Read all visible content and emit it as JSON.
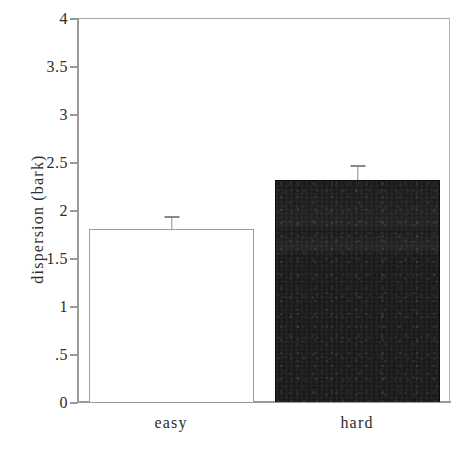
{
  "chart_data": {
    "type": "bar",
    "title": "",
    "xlabel": "",
    "ylabel": "dispersion (bark)",
    "categories": [
      "easy",
      "hard"
    ],
    "values": [
      1.8,
      2.31
    ],
    "errors": [
      0.14,
      0.16
    ],
    "series": [
      {
        "name": "dispersion",
        "values": [
          1.8,
          2.31
        ],
        "errors": [
          0.14,
          0.16
        ]
      }
    ],
    "ylim": [
      0,
      4
    ],
    "yticks": [
      0,
      0.5,
      1,
      1.5,
      2,
      2.5,
      3,
      3.5,
      4
    ],
    "ytick_labels": [
      "0",
      ".5",
      "1",
      "1.5",
      "2",
      "2.5",
      "3",
      "3.5",
      "4"
    ],
    "grid": false,
    "legend": null,
    "bar_styles": [
      "open",
      "filled"
    ],
    "colors": {
      "bar_open_fill": "#ffffff",
      "bar_open_stroke": "#9d9d9d",
      "bar_filled_fill": "#151515",
      "axis": "#9a9a9a",
      "text": "#2b2b2b"
    }
  },
  "axis": {
    "y_title": "dispersion (bark)",
    "tick_labels": [
      "4",
      "3.5",
      "3",
      "2.5",
      "2",
      "1.5",
      "1",
      ".5",
      "0"
    ],
    "x_labels": [
      "easy",
      "hard"
    ]
  }
}
